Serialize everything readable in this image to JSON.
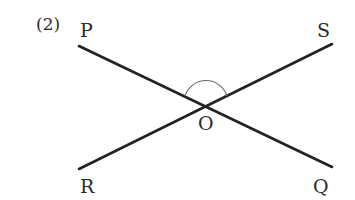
{
  "problem_number": "(2)",
  "points": {
    "P": "P",
    "S": "S",
    "O": "O",
    "R": "R",
    "Q": "Q"
  },
  "lines": [
    {
      "name": "PQ",
      "from": "P",
      "to": "Q"
    },
    {
      "name": "RS",
      "from": "R",
      "to": "S"
    }
  ],
  "angle_marked": "∠POS",
  "colors": {
    "line": "#222222",
    "arc": "#6a6a6a",
    "text": "#2b2b2b"
  }
}
